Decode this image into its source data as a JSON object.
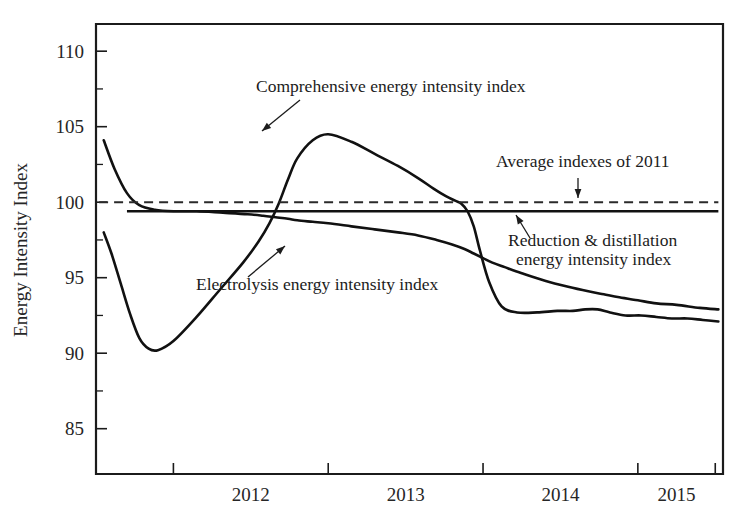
{
  "chart_data": {
    "type": "line",
    "title": "",
    "xlabel": "",
    "ylabel": "Energy Intensity Index",
    "xlim": [
      2011.5,
      2015.55
    ],
    "ylim": [
      82.0,
      111.8
    ],
    "grid": false,
    "legend_position": "inline-annotations",
    "y_ticks": [
      85,
      90,
      95,
      100,
      105,
      110
    ],
    "y_ticklabels": [
      "85",
      "90",
      "95",
      "100",
      "105",
      "110"
    ],
    "y_minor_ticks": [
      87.5,
      92.5,
      97.5,
      102.5,
      107.5
    ],
    "x_ticks": [
      2012.0,
      2013.0,
      2014.0,
      2015.0,
      2015.5
    ],
    "x_ticklabels": [
      "2012",
      "2013",
      "2014",
      "2015"
    ],
    "x_label_positions": [
      2012.5,
      2013.5,
      2014.5,
      2015.25
    ],
    "series": [
      {
        "name": "Comprehensive energy intensity index",
        "style": "solid",
        "x": [
          2011.55,
          2011.62,
          2011.7,
          2011.78,
          2011.88,
          2012.0,
          2012.15,
          2012.32,
          2012.48,
          2012.58,
          2012.66,
          2012.74,
          2012.8,
          2012.9,
          2013.0,
          2013.15,
          2013.3,
          2013.45,
          2013.58,
          2013.7,
          2013.8,
          2013.88,
          2013.94,
          2014.0,
          2014.06,
          2014.14,
          2014.25,
          2014.4,
          2014.55,
          2014.68,
          2014.78,
          2014.88,
          2015.0,
          2015.12,
          2015.25,
          2015.4,
          2015.52
        ],
        "y": [
          104.1,
          102.2,
          100.6,
          99.8,
          99.5,
          99.4,
          99.4,
          99.3,
          99.2,
          99.1,
          99.0,
          98.9,
          98.8,
          98.7,
          98.6,
          98.4,
          98.2,
          98.0,
          97.8,
          97.5,
          97.2,
          96.9,
          96.6,
          96.3,
          96.0,
          95.7,
          95.3,
          94.8,
          94.4,
          94.1,
          93.9,
          93.7,
          93.5,
          93.3,
          93.2,
          93.0,
          92.9
        ]
      },
      {
        "name": "Electrolysis energy intensity index",
        "style": "solid",
        "x": [
          2011.55,
          2011.6,
          2011.66,
          2011.72,
          2011.78,
          2011.84,
          2011.9,
          2012.0,
          2012.15,
          2012.3,
          2012.45,
          2012.55,
          2012.62,
          2012.68,
          2012.74,
          2012.8,
          2012.9,
          2013.0,
          2013.15,
          2013.3,
          2013.45,
          2013.58,
          2013.68,
          2013.76,
          2013.82,
          2013.86,
          2013.9,
          2013.94,
          2013.98,
          2014.04,
          2014.12,
          2014.22,
          2014.35,
          2014.48,
          2014.58,
          2014.66,
          2014.74,
          2014.82,
          2014.92,
          2015.02,
          2015.12,
          2015.22,
          2015.32,
          2015.42,
          2015.52
        ],
        "y": [
          98.0,
          96.6,
          94.6,
          92.6,
          91.0,
          90.3,
          90.2,
          90.8,
          92.4,
          94.2,
          96.0,
          97.4,
          98.6,
          99.9,
          101.5,
          102.9,
          104.1,
          104.5,
          104.0,
          103.2,
          102.4,
          101.6,
          100.9,
          100.4,
          100.1,
          99.9,
          99.4,
          98.4,
          96.8,
          94.7,
          93.1,
          92.7,
          92.7,
          92.8,
          92.8,
          92.9,
          92.9,
          92.7,
          92.5,
          92.5,
          92.4,
          92.3,
          92.3,
          92.2,
          92.1
        ]
      },
      {
        "name": "Reduction & distillation energy intensity index",
        "style": "solid-flat",
        "x": [
          2011.7,
          2015.52
        ],
        "y": [
          99.4,
          99.4
        ]
      },
      {
        "name": "Average indexes of 2011",
        "style": "dashed",
        "x": [
          2011.52,
          2015.52
        ],
        "y": [
          100.0,
          100.0
        ]
      }
    ],
    "annotations": [
      {
        "id": "comprehensive-label",
        "text": "Comprehensive energy intensity index",
        "text_anchor_px": [
          256,
          92
        ],
        "arrow_from_px": [
          300,
          100
        ],
        "arrow_to_px": [
          262,
          131
        ]
      },
      {
        "id": "average-2011-label",
        "text": "Average indexes of 2011",
        "text_anchor_px": [
          496,
          167
        ],
        "arrow_from_px": [
          578,
          178
        ],
        "arrow_to_px": [
          578,
          198
        ]
      },
      {
        "id": "reduction-label-line1",
        "text": "Reduction & distillation",
        "text_anchor_px": [
          508,
          246
        ]
      },
      {
        "id": "reduction-label-line2",
        "text": "energy intensity index",
        "text_anchor_px": [
          516,
          265
        ]
      },
      {
        "id": "reduction-arrow",
        "arrow_from_px": [
          530,
          238
        ],
        "arrow_to_px": [
          516,
          215
        ]
      },
      {
        "id": "electrolysis-label",
        "text": "Electrolysis energy intensity index",
        "text_anchor_px": [
          196,
          290
        ]
      },
      {
        "id": "electrolysis-arrow",
        "arrow_from_px": [
          248,
          277
        ],
        "arrow_to_px": [
          285,
          246
        ]
      }
    ]
  },
  "figure": {
    "y_axis_title": "Energy Intensity Index"
  }
}
